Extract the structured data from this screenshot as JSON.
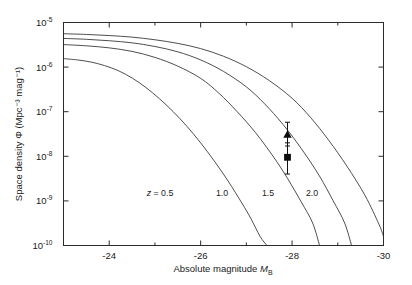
{
  "chart_data": {
    "type": "line",
    "title": "",
    "xlabel": "Absolute magnitude M_B",
    "xlabel_main": "Absolute magnitude",
    "xlabel_symbol": "M",
    "xlabel_subscript": "B",
    "ylabel": "Space density Φ (Mpc⁻³ mag⁻¹)",
    "ylabel_main": "Space density",
    "ylabel_symbol": "Φ",
    "ylabel_units": "(Mpc⁻³ mag⁻¹)",
    "xlim": [
      -23.0,
      -30.0
    ],
    "ylim": [
      1e-10,
      1e-05
    ],
    "yscale": "log",
    "grid": false,
    "legend": "inline-curve-labels",
    "xticks": [
      -24,
      -26,
      -28,
      -30
    ],
    "xticklabels": [
      "-24",
      "-26",
      "-28",
      "-30"
    ],
    "xminorticks": [
      -25,
      -27,
      -29
    ],
    "yticks": [
      1e-05,
      1e-06,
      1e-07,
      1e-08,
      1e-09,
      1e-10
    ],
    "yticklabels": [
      "10",
      "10",
      "10",
      "10",
      "10",
      "10"
    ],
    "yticksuperscripts": [
      "-5",
      "-6",
      "-7",
      "-8",
      "-9",
      "-10"
    ],
    "series": [
      {
        "name": "z = 0.5",
        "label": "z = 0.5",
        "label_prefix": "z",
        "label_eq": "=",
        "label_value": "0.5",
        "points": [
          [
            -23.0,
            1.55e-06
          ],
          [
            -23.3,
            1.45e-06
          ],
          [
            -23.6,
            1.3e-06
          ],
          [
            -23.9,
            1.08e-06
          ],
          [
            -24.2,
            8.3e-07
          ],
          [
            -24.5,
            5.7e-07
          ],
          [
            -24.8,
            3.5e-07
          ],
          [
            -25.1,
            1.95e-07
          ],
          [
            -25.4,
            1e-07
          ],
          [
            -25.7,
            4.7e-08
          ],
          [
            -26.0,
            2e-08
          ],
          [
            -26.3,
            7.8e-09
          ],
          [
            -26.6,
            2.8e-09
          ],
          [
            -26.9,
            9e-10
          ],
          [
            -27.1,
            4e-10
          ],
          [
            -27.3,
            1.6e-10
          ],
          [
            -27.45,
            1e-10
          ]
        ]
      },
      {
        "name": "1.0",
        "label": "1.0",
        "label_value": "1.0",
        "points": [
          [
            -23.0,
            3.2e-06
          ],
          [
            -23.5,
            3e-06
          ],
          [
            -24.0,
            2.7e-06
          ],
          [
            -24.5,
            2.25e-06
          ],
          [
            -25.0,
            1.65e-06
          ],
          [
            -25.5,
            1.05e-06
          ],
          [
            -26.0,
            5.6e-07
          ],
          [
            -26.4,
            2.6e-07
          ],
          [
            -26.8,
            1e-07
          ],
          [
            -27.2,
            3.4e-08
          ],
          [
            -27.6,
            9.5e-09
          ],
          [
            -27.9,
            3.2e-09
          ],
          [
            -28.2,
            9.5e-10
          ],
          [
            -28.45,
            3.2e-10
          ],
          [
            -28.6,
            1e-10
          ]
        ]
      },
      {
        "name": "1.5",
        "label": "1.5",
        "label_value": "1.5",
        "points": [
          [
            -23.0,
            4.4e-06
          ],
          [
            -23.5,
            4.2e-06
          ],
          [
            -24.0,
            3.9e-06
          ],
          [
            -24.5,
            3.5e-06
          ],
          [
            -25.0,
            2.9e-06
          ],
          [
            -25.5,
            2.2e-06
          ],
          [
            -26.0,
            1.45e-06
          ],
          [
            -26.5,
            8e-07
          ],
          [
            -27.0,
            3.6e-07
          ],
          [
            -27.4,
            1.5e-07
          ],
          [
            -27.8,
            5.2e-08
          ],
          [
            -28.2,
            1.5e-08
          ],
          [
            -28.6,
            3.6e-09
          ],
          [
            -28.9,
            1e-09
          ],
          [
            -29.15,
            3.2e-10
          ],
          [
            -29.3,
            1e-10
          ]
        ]
      },
      {
        "name": "2.0",
        "label": "2.0",
        "label_value": "2.0",
        "points": [
          [
            -23.0,
            5.6e-06
          ],
          [
            -23.5,
            5.4e-06
          ],
          [
            -24.0,
            5.1e-06
          ],
          [
            -24.5,
            4.7e-06
          ],
          [
            -25.0,
            4.1e-06
          ],
          [
            -25.5,
            3.4e-06
          ],
          [
            -26.0,
            2.6e-06
          ],
          [
            -26.5,
            1.75e-06
          ],
          [
            -27.0,
            1.02e-06
          ],
          [
            -27.5,
            5e-07
          ],
          [
            -28.0,
            2e-07
          ],
          [
            -28.4,
            7.5e-08
          ],
          [
            -28.8,
            2.3e-08
          ],
          [
            -29.2,
            6e-09
          ],
          [
            -29.6,
            1.3e-09
          ],
          [
            -29.9,
            3e-10
          ],
          [
            -30.0,
            1.6e-10
          ]
        ]
      }
    ],
    "data_points": [
      {
        "name": "observed-point-upper",
        "marker": "triangle",
        "x": -27.9,
        "y": 3.1e-08,
        "yerr_low": 1.7e-08,
        "yerr_high": 5.8e-08
      },
      {
        "name": "observed-point-lower",
        "marker": "square",
        "x": -27.9,
        "y": 9.5e-09,
        "yerr_low": 4e-09,
        "yerr_high": 2e-08
      }
    ]
  },
  "colors": {
    "axis": "#2b2b2b",
    "curve": "#3a3a3a",
    "marker": "#0d0d0d",
    "background": "#ffffff"
  }
}
